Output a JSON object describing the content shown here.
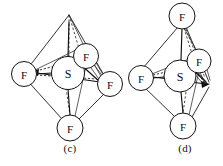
{
  "figure": {
    "background_color": "#ffffff",
    "line_color": "#141414",
    "atom_fill": "#ffffff",
    "panels": [
      {
        "id": "panel-c",
        "caption": "(c)",
        "caption_x": 50,
        "caption_y": 142,
        "apex_type": "vacant-vertex",
        "center_atom": {
          "label": "S",
          "cx": 68,
          "cy": 73,
          "r": 16.5,
          "font_size": 12
        },
        "ligands": [
          {
            "name": "fluorine-top-apex",
            "label": "",
            "cx": 69,
            "cy": 14,
            "r": 0,
            "font_size": 0,
            "visible": false
          },
          {
            "name": "fluorine-left",
            "label": "F",
            "cx": 24,
            "cy": 74,
            "r": 12.5,
            "font_size": 11
          },
          {
            "name": "fluorine-front",
            "label": "F",
            "cx": 86,
            "cy": 56,
            "r": 12.5,
            "font_size": 11
          },
          {
            "name": "fluorine-right",
            "label": "F",
            "cx": 110,
            "cy": 84,
            "r": 12.5,
            "font_size": 11
          },
          {
            "name": "fluorine-bottom",
            "label": "F",
            "cx": 70,
            "cy": 128,
            "r": 13.0,
            "font_size": 11
          }
        ],
        "arrow_at": "left"
      },
      {
        "id": "panel-d",
        "caption": "(d)",
        "caption_x": 165,
        "caption_y": 142,
        "apex_type": "fluorine-vertex",
        "center_atom": {
          "label": "S",
          "cx": 180,
          "cy": 76,
          "r": 16.0,
          "font_size": 12
        },
        "ligands": [
          {
            "name": "fluorine-top",
            "label": "F",
            "cx": 182,
            "cy": 16,
            "r": 13.0,
            "font_size": 11,
            "visible": true
          },
          {
            "name": "fluorine-left",
            "label": "F",
            "cx": 141,
            "cy": 78,
            "r": 12.5,
            "font_size": 11
          },
          {
            "name": "fluorine-front",
            "label": "F",
            "cx": 199,
            "cy": 61,
            "r": 12.0,
            "font_size": 11
          },
          {
            "name": "fluorine-bottom",
            "label": "F",
            "cx": 183,
            "cy": 126,
            "r": 13.0,
            "font_size": 11
          }
        ],
        "arrow_at": "right"
      }
    ],
    "chemistry": {
      "central_element": "S",
      "ligand_element": "F",
      "geometry": "octahedral / square bipyramidal"
    }
  }
}
